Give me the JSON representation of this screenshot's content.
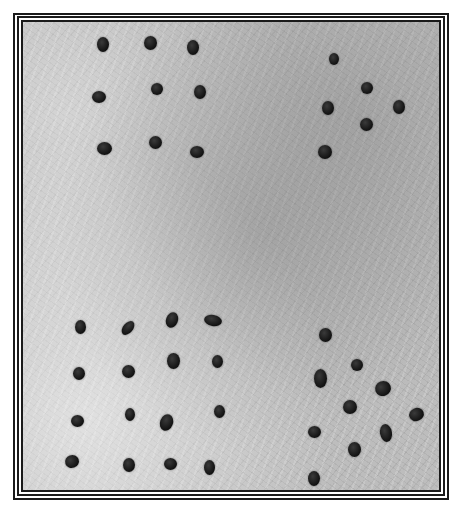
{
  "image": {
    "description": "Black-and-white photograph of dark seeds arranged in four groups on a textured fibrous surface, framed by a triple-line border",
    "colors": {
      "background": "#ffffff",
      "border": "#1a1a1a",
      "surface": "#bdbdbd",
      "seed": "#1a1a1a"
    },
    "seed_groups": [
      {
        "name": "top-left",
        "seeds": [
          [
            103,
            44,
            12,
            15,
            0
          ],
          [
            150,
            43,
            13,
            14,
            0
          ],
          [
            193,
            47,
            12,
            15,
            0
          ],
          [
            99,
            97,
            14,
            12,
            0
          ],
          [
            157,
            89,
            12,
            12,
            0
          ],
          [
            200,
            92,
            12,
            14,
            0
          ],
          [
            104,
            148,
            15,
            13,
            0
          ],
          [
            155,
            142,
            13,
            13,
            0
          ],
          [
            197,
            152,
            14,
            12,
            0
          ]
        ]
      },
      {
        "name": "top-right",
        "seeds": [
          [
            334,
            59,
            10,
            12,
            0
          ],
          [
            367,
            88,
            12,
            12,
            0
          ],
          [
            328,
            108,
            12,
            14,
            0
          ],
          [
            399,
            107,
            12,
            14,
            0
          ],
          [
            366,
            124,
            13,
            13,
            0
          ],
          [
            325,
            152,
            14,
            14,
            0
          ]
        ]
      },
      {
        "name": "bottom-left",
        "seeds": [
          [
            80,
            327,
            11,
            14,
            0
          ],
          [
            128,
            328,
            10,
            16,
            40
          ],
          [
            172,
            320,
            12,
            16,
            20
          ],
          [
            213,
            320,
            18,
            11,
            10
          ],
          [
            79,
            373,
            12,
            13,
            0
          ],
          [
            128,
            371,
            13,
            13,
            0
          ],
          [
            173,
            361,
            13,
            16,
            0
          ],
          [
            217,
            361,
            11,
            13,
            0
          ],
          [
            77,
            421,
            13,
            12,
            0
          ],
          [
            130,
            414,
            10,
            13,
            0
          ],
          [
            166,
            422,
            13,
            17,
            20
          ],
          [
            219,
            411,
            11,
            13,
            0
          ],
          [
            72,
            461,
            14,
            13,
            -20
          ],
          [
            129,
            465,
            12,
            14,
            0
          ],
          [
            170,
            464,
            13,
            12,
            0
          ],
          [
            209,
            467,
            11,
            15,
            0
          ]
        ]
      },
      {
        "name": "bottom-right",
        "seeds": [
          [
            325,
            335,
            13,
            14,
            0
          ],
          [
            357,
            365,
            12,
            12,
            0
          ],
          [
            320,
            378,
            13,
            19,
            0
          ],
          [
            383,
            388,
            16,
            15,
            -20
          ],
          [
            350,
            407,
            14,
            14,
            0
          ],
          [
            416,
            414,
            15,
            13,
            -20
          ],
          [
            314,
            432,
            13,
            12,
            0
          ],
          [
            386,
            433,
            12,
            18,
            -10
          ],
          [
            354,
            449,
            13,
            15,
            0
          ],
          [
            314,
            478,
            12,
            15,
            0
          ]
        ]
      }
    ]
  }
}
